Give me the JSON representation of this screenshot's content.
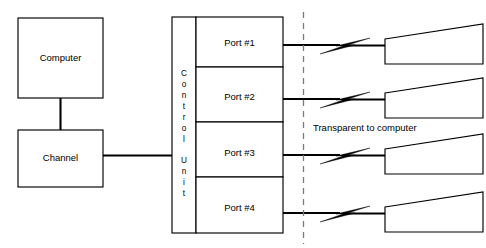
{
  "diagram": {
    "canvas": {
      "width": 486,
      "height": 248,
      "background": "#ffffff"
    },
    "colors": {
      "stroke": "#000000",
      "background": "#ffffff",
      "dashed_boundary": "#7a7a7a"
    },
    "nodes": {
      "computer": {
        "label": "Computer",
        "x": 18,
        "y": 18,
        "width": 85,
        "height": 80
      },
      "channel": {
        "label": "Channel",
        "x": 18,
        "y": 130,
        "width": 85,
        "height": 57
      },
      "control_unit": {
        "label": "Control Unit",
        "letters": [
          "C",
          "o",
          "n",
          "t",
          "r",
          "o",
          "l",
          "",
          "U",
          "n",
          "i",
          "t"
        ],
        "x": 172,
        "y": 17,
        "width": 24,
        "height": 216
      }
    },
    "ports": [
      {
        "label": "Port #1",
        "x": 196,
        "y": 17,
        "width": 87,
        "height": 50,
        "wire_y": 45
      },
      {
        "label": "Port #2",
        "x": 196,
        "y": 67,
        "width": 87,
        "height": 55,
        "wire_y": 99
      },
      {
        "label": "Port #3",
        "x": 196,
        "y": 122,
        "width": 87,
        "height": 55,
        "wire_y": 155
      },
      {
        "label": "Port #4",
        "x": 196,
        "y": 177,
        "width": 87,
        "height": 56,
        "wire_y": 213
      }
    ],
    "devices": [
      {
        "name": "device-1",
        "x": 385,
        "y": 24,
        "width": 98,
        "height": 40,
        "left_top_offset": 15
      },
      {
        "name": "device-2",
        "x": 385,
        "y": 78,
        "width": 98,
        "height": 40,
        "left_top_offset": 15
      },
      {
        "name": "device-3",
        "x": 385,
        "y": 134,
        "width": 98,
        "height": 40,
        "left_top_offset": 15
      },
      {
        "name": "device-4",
        "x": 385,
        "y": 192,
        "width": 98,
        "height": 40,
        "left_top_offset": 15
      }
    ],
    "boundary": {
      "label": "Transparent to computer",
      "x": 303,
      "y_top": 12,
      "y_bottom": 244,
      "label_x": 313,
      "label_y": 128
    },
    "links": {
      "computer_to_channel": {
        "from": "computer",
        "to": "channel",
        "x": 60,
        "y1": 98,
        "y2": 130
      },
      "channel_to_control_unit": {
        "from": "channel",
        "to": "control-unit",
        "x1": 103,
        "x2": 184,
        "y": 155
      }
    }
  }
}
